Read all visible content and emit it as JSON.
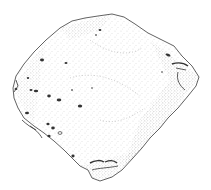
{
  "image": {
    "description": "Stippled pen-and-ink illustration of a roughly rhomboid stone artifact with pitted surface",
    "background_color": "#ffffff",
    "ink_color": "#3a3a3a",
    "stipple_color": "#6a6a6a"
  }
}
